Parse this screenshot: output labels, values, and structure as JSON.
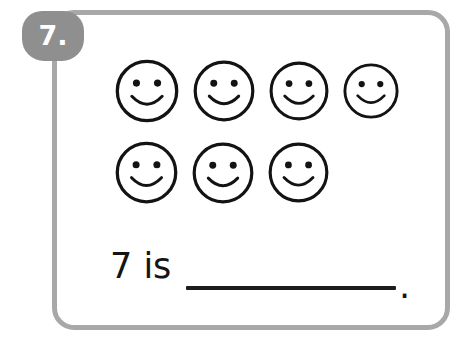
{
  "worksheet": {
    "problem_number": "7.",
    "frame_color": "#a8a8a8",
    "badge_color": "#8f8f8f",
    "ink_color": "#141414",
    "background_color": "#ffffff"
  },
  "counting_set": {
    "icon_name": "smiley-face-icon",
    "total_count": 7,
    "rows": [
      {
        "row_label": "row-1",
        "count": 4,
        "faces": [
          {
            "size": 66
          },
          {
            "size": 64
          },
          {
            "size": 62
          },
          {
            "size": 58
          }
        ]
      },
      {
        "row_label": "row-2",
        "count": 3,
        "faces": [
          {
            "size": 65
          },
          {
            "size": 64
          },
          {
            "size": 63
          }
        ]
      }
    ]
  },
  "prompt": {
    "text": "7 is",
    "blank_label": "answer-blank",
    "terminator": "."
  }
}
